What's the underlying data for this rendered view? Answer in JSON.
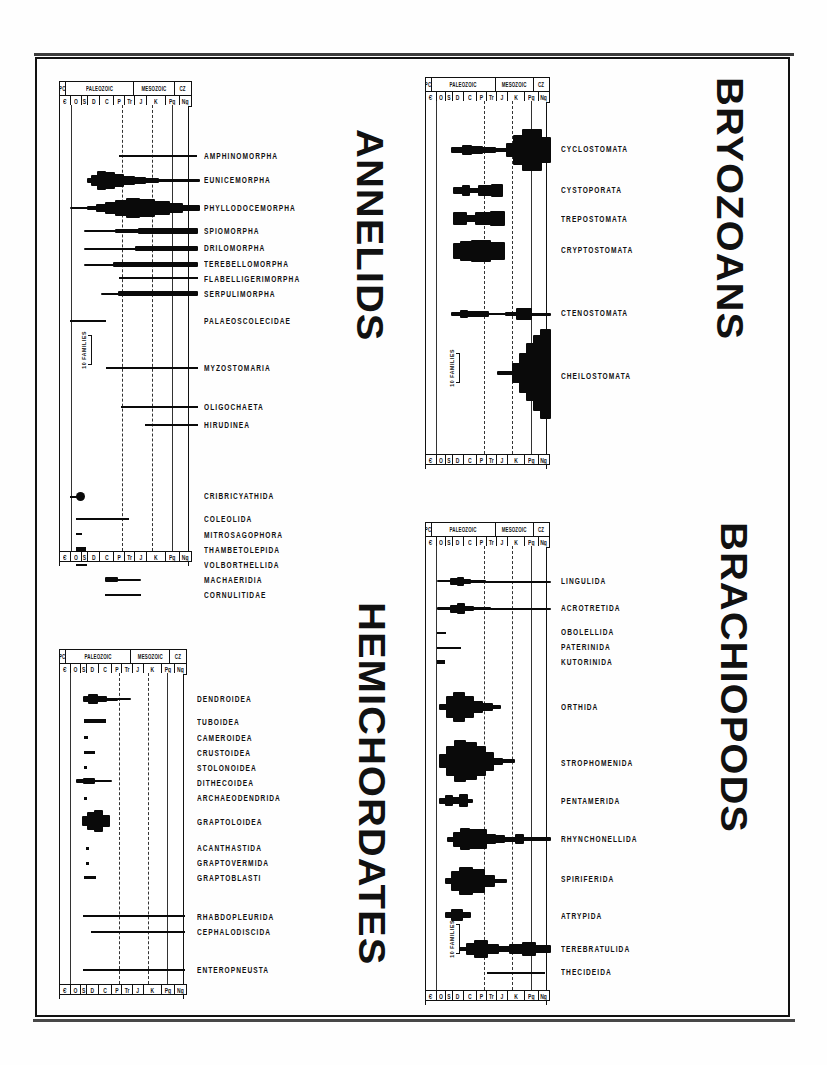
{
  "figure": {
    "kind": "spindle-diagram-plate",
    "scale_note": "10 FAMILIES",
    "ink_color": "#0a0a0a",
    "paper_color": "#fefefe"
  },
  "timescale": {
    "eras": [
      {
        "label": "PC",
        "width": 5
      },
      {
        "label": "PALEOZOIC",
        "width": 52
      },
      {
        "label": "MESOZOIC",
        "width": 31
      },
      {
        "label": "CZ",
        "width": 12
      }
    ],
    "periods": [
      {
        "label": "Є",
        "width": 9
      },
      {
        "label": "O",
        "width": 8
      },
      {
        "label": "S",
        "width": 5
      },
      {
        "label": "D",
        "width": 9
      },
      {
        "label": "C",
        "width": 11
      },
      {
        "label": "P",
        "width": 8
      },
      {
        "label": "Tr",
        "width": 8
      },
      {
        "label": "J",
        "width": 9
      },
      {
        "label": "K",
        "width": 14
      },
      {
        "label": "Pg",
        "width": 11
      },
      {
        "label": "Ng",
        "width": 8
      }
    ]
  },
  "panels": [
    {
      "id": "annelids",
      "title": "ANNELIDS",
      "taxa": [
        {
          "name": "AMPHINOMORPHA",
          "label_y": 75
        },
        {
          "name": "EUNICEMORPHA",
          "label_y": 99
        },
        {
          "name": "PHYLLODOCEMORPHA",
          "label_y": 127
        },
        {
          "name": "SPIOMORPHA",
          "label_y": 150
        },
        {
          "name": "DRILOMORPHA",
          "label_y": 167
        },
        {
          "name": "TEREBELLOMORPHA",
          "label_y": 183
        },
        {
          "name": "FLABELLIGERIMORPHA",
          "label_y": 198
        },
        {
          "name": "SERPULIMORPHA",
          "label_y": 213
        },
        {
          "name": "PALAEOSCOLECIDAE",
          "label_y": 240
        },
        {
          "name": "MYZOSTOMARIA",
          "label_y": 287
        },
        {
          "name": "OLIGOCHAETA",
          "label_y": 326
        },
        {
          "name": "HIRUDINEA",
          "label_y": 344
        },
        {
          "name": "CRIBRICYATHIDA",
          "label_y": 415
        },
        {
          "name": "COLEOLIDA",
          "label_y": 438
        },
        {
          "name": "MITROSAGOPHORA",
          "label_y": 454
        },
        {
          "name": "THAMBETOLEPIDA",
          "label_y": 469
        },
        {
          "name": "VOLBORTHELLIDA",
          "label_y": 484
        },
        {
          "name": "MACHAERIDIA",
          "label_y": 499
        },
        {
          "name": "CORNULITIDAE",
          "label_y": 514
        }
      ]
    },
    {
      "id": "bryozoans",
      "title": "BRYOZOANS",
      "taxa": [
        {
          "name": "CYCLOSTOMATA",
          "label_y": 72
        },
        {
          "name": "CYSTOPORATA",
          "label_y": 113
        },
        {
          "name": "TREPOSTOMATA",
          "label_y": 142
        },
        {
          "name": "CRYPTOSTOMATA",
          "label_y": 172
        },
        {
          "name": "CTENOSTOMATA",
          "label_y": 234
        },
        {
          "name": "CHEILOSTOMATA",
          "label_y": 297
        }
      ]
    },
    {
      "id": "hemichordates",
      "title": "HEMICHORDATES",
      "taxa": [
        {
          "name": "DENDROIDEA",
          "label_y": 49
        },
        {
          "name": "TUBOIDEA",
          "label_y": 72
        },
        {
          "name": "CAMEROIDEA",
          "label_y": 88
        },
        {
          "name": "CRUSTOIDEA",
          "label_y": 103
        },
        {
          "name": "STOLONOIDEA",
          "label_y": 118
        },
        {
          "name": "DITHECOIDEA",
          "label_y": 133
        },
        {
          "name": "ARCHAEODENDRIDA",
          "label_y": 148
        },
        {
          "name": "GRAPTOLOIDEA",
          "label_y": 172
        },
        {
          "name": "ACANTHASTIDA",
          "label_y": 198
        },
        {
          "name": "GRAPTOVERMIDA",
          "label_y": 213
        },
        {
          "name": "GRAPTOBLASTI",
          "label_y": 228
        },
        {
          "name": "RHABDOPLEURIDA",
          "label_y": 267
        },
        {
          "name": "CEPHALODISCIDA",
          "label_y": 282
        },
        {
          "name": "ENTEROPNEUSTA",
          "label_y": 320
        }
      ]
    },
    {
      "id": "brachiopods",
      "title": "BRACHIOPODS",
      "taxa": [
        {
          "name": "LINGULIDA",
          "label_y": 59
        },
        {
          "name": "ACROTRETIDA",
          "label_y": 86
        },
        {
          "name": "OBOLELLIDA",
          "label_y": 110
        },
        {
          "name": "PATERINIDA",
          "label_y": 125
        },
        {
          "name": "KUTORINIDA",
          "label_y": 140
        },
        {
          "name": "ORTHIDA",
          "label_y": 185
        },
        {
          "name": "STROPHOMENIDA",
          "label_y": 241
        },
        {
          "name": "PENTAMERIDA",
          "label_y": 279
        },
        {
          "name": "RHYNCHONELLIDA",
          "label_y": 317
        },
        {
          "name": "SPIRIFERIDA",
          "label_y": 357
        },
        {
          "name": "ATRYPIDA",
          "label_y": 394
        },
        {
          "name": "TEREBRATULIDA",
          "label_y": 427
        },
        {
          "name": "THECIDEIDA",
          "label_y": 450
        }
      ]
    }
  ],
  "chart_data": {
    "type": "area",
    "xlabel": "Geologic time (periods)",
    "ylabel": "Taxonomic group",
    "grid": true,
    "legend": "none",
    "x_axis": {
      "eras": [
        "PC",
        "PALEOZOIC",
        "MESOZOIC",
        "CZ"
      ],
      "periods": [
        "Є",
        "O",
        "S",
        "D",
        "C",
        "P",
        "Tr",
        "J",
        "K",
        "Pg",
        "Ng"
      ],
      "period_names": [
        "Cambrian",
        "Ordovician",
        "Silurian",
        "Devonian",
        "Carboniferous",
        "Permian",
        "Triassic",
        "Jurassic",
        "Cretaceous",
        "Paleogene",
        "Neogene"
      ]
    },
    "y_scale_unit": "10 FAMILIES",
    "series": [
      {
        "name": "AMPHINOMORPHA",
        "group": "Annelids",
        "range": [
          "C",
          "Ng"
        ],
        "max_families": 1
      },
      {
        "name": "EUNICEMORPHA",
        "group": "Annelids",
        "range": [
          "O",
          "Ng"
        ],
        "max_families": 9
      },
      {
        "name": "PHYLLODOCEMORPHA",
        "group": "Annelids",
        "range": [
          "Є",
          "Ng"
        ],
        "max_families": 14
      },
      {
        "name": "SPIOMORPHA",
        "group": "Annelids",
        "range": [
          "O",
          "Ng"
        ],
        "max_families": 3
      },
      {
        "name": "DRILOMORPHA",
        "group": "Annelids",
        "range": [
          "O",
          "Ng"
        ],
        "max_families": 2
      },
      {
        "name": "TEREBELLOMORPHA",
        "group": "Annelids",
        "range": [
          "O",
          "Ng"
        ],
        "max_families": 3
      },
      {
        "name": "FLABELLIGERIMORPHA",
        "group": "Annelids",
        "range": [
          "C",
          "Ng"
        ],
        "max_families": 1
      },
      {
        "name": "SERPULIMORPHA",
        "group": "Annelids",
        "range": [
          "S",
          "Ng"
        ],
        "max_families": 4
      },
      {
        "name": "PALAEOSCOLECIDAE",
        "group": "Annelids",
        "range": [
          "Є",
          "S"
        ],
        "max_families": 1
      },
      {
        "name": "MYZOSTOMARIA",
        "group": "Annelids",
        "range": [
          "D",
          "Ng"
        ],
        "max_families": 1
      },
      {
        "name": "OLIGOCHAETA",
        "group": "Annelids",
        "range": [
          "C",
          "Ng"
        ],
        "max_families": 1
      },
      {
        "name": "HIRUDINEA",
        "group": "Annelids",
        "range": [
          "J",
          "Ng"
        ],
        "max_families": 1
      },
      {
        "name": "CRIBRICYATHIDA",
        "group": "Annelids",
        "range": [
          "Є",
          "Є"
        ],
        "max_families": 4
      },
      {
        "name": "COLEOLIDA",
        "group": "Annelids",
        "range": [
          "Є",
          "O"
        ],
        "max_families": 1
      },
      {
        "name": "MITROSAGOPHORA",
        "group": "Annelids",
        "range": [
          "Є",
          "Є"
        ],
        "max_families": 1
      },
      {
        "name": "THAMBETOLEPIDA",
        "group": "Annelids",
        "range": [
          "Є",
          "Є"
        ],
        "max_families": 2
      },
      {
        "name": "VOLBORTHELLIDA",
        "group": "Annelids",
        "range": [
          "Є",
          "Є"
        ],
        "max_families": 1
      },
      {
        "name": "MACHAERIDIA",
        "group": "Annelids",
        "range": [
          "O",
          "C"
        ],
        "max_families": 3
      },
      {
        "name": "CORNULITIDAE",
        "group": "Annelids",
        "range": [
          "O",
          "C"
        ],
        "max_families": 1
      },
      {
        "name": "CYCLOSTOMATA",
        "group": "Bryozoans",
        "range": [
          "O",
          "Ng"
        ],
        "max_families": 20
      },
      {
        "name": "CYSTOPORATA",
        "group": "Bryozoans",
        "range": [
          "O",
          "P"
        ],
        "max_families": 6
      },
      {
        "name": "TREPOSTOMATA",
        "group": "Bryozoans",
        "range": [
          "O",
          "Tr"
        ],
        "max_families": 7
      },
      {
        "name": "CRYPTOSTOMATA",
        "group": "Bryozoans",
        "range": [
          "O",
          "P"
        ],
        "max_families": 10
      },
      {
        "name": "CTENOSTOMATA",
        "group": "Bryozoans",
        "range": [
          "O",
          "Ng"
        ],
        "max_families": 6
      },
      {
        "name": "CHEILOSTOMATA",
        "group": "Bryozoans",
        "range": [
          "J",
          "Ng"
        ],
        "max_families": 40
      },
      {
        "name": "DENDROIDEA",
        "group": "Hemichordates",
        "range": [
          "Є",
          "C"
        ],
        "max_families": 4
      },
      {
        "name": "TUBOIDEA",
        "group": "Hemichordates",
        "range": [
          "O",
          "S"
        ],
        "max_families": 2
      },
      {
        "name": "CAMEROIDEA",
        "group": "Hemichordates",
        "range": [
          "O",
          "O"
        ],
        "max_families": 1
      },
      {
        "name": "CRUSTOIDEA",
        "group": "Hemichordates",
        "range": [
          "O",
          "S"
        ],
        "max_families": 1
      },
      {
        "name": "STOLONOIDEA",
        "group": "Hemichordates",
        "range": [
          "O",
          "O"
        ],
        "max_families": 1
      },
      {
        "name": "DITHECOIDEA",
        "group": "Hemichordates",
        "range": [
          "Є",
          "O"
        ],
        "max_families": 3
      },
      {
        "name": "ARCHAEODENDRIDA",
        "group": "Hemichordates",
        "range": [
          "Є",
          "O"
        ],
        "max_families": 1
      },
      {
        "name": "GRAPTOLOIDEA",
        "group": "Hemichordates",
        "range": [
          "O",
          "D"
        ],
        "max_families": 9
      },
      {
        "name": "ACANTHASTIDA",
        "group": "Hemichordates",
        "range": [
          "O",
          "O"
        ],
        "max_families": 1
      },
      {
        "name": "GRAPTOVERMIDA",
        "group": "Hemichordates",
        "range": [
          "O",
          "O"
        ],
        "max_families": 1
      },
      {
        "name": "GRAPTOBLASTI",
        "group": "Hemichordates",
        "range": [
          "O",
          "S"
        ],
        "max_families": 1
      },
      {
        "name": "RHABDOPLEURIDA",
        "group": "Hemichordates",
        "range": [
          "Є",
          "Ng"
        ],
        "max_families": 1
      },
      {
        "name": "CEPHALODISCIDA",
        "group": "Hemichordates",
        "range": [
          "Є",
          "Ng"
        ],
        "max_families": 1
      },
      {
        "name": "ENTEROPNEUSTA",
        "group": "Hemichordates",
        "range": [
          "Є",
          "Ng"
        ],
        "max_families": 1
      },
      {
        "name": "LINGULIDA",
        "group": "Brachiopods",
        "range": [
          "Є",
          "Ng"
        ],
        "max_families": 5
      },
      {
        "name": "ACROTRETIDA",
        "group": "Brachiopods",
        "range": [
          "Є",
          "Ng"
        ],
        "max_families": 6
      },
      {
        "name": "OBOLELLIDA",
        "group": "Brachiopods",
        "range": [
          "Є",
          "Є"
        ],
        "max_families": 1
      },
      {
        "name": "PATERINIDA",
        "group": "Brachiopods",
        "range": [
          "Є",
          "O"
        ],
        "max_families": 1
      },
      {
        "name": "KUTORINIDA",
        "group": "Brachiopods",
        "range": [
          "Є",
          "Є"
        ],
        "max_families": 2
      },
      {
        "name": "ORTHIDA",
        "group": "Brachiopods",
        "range": [
          "Є",
          "P"
        ],
        "max_families": 16
      },
      {
        "name": "STROPHOMENIDA",
        "group": "Brachiopods",
        "range": [
          "Є",
          "Tr"
        ],
        "max_families": 26
      },
      {
        "name": "PENTAMERIDA",
        "group": "Brachiopods",
        "range": [
          "Є",
          "D"
        ],
        "max_families": 6
      },
      {
        "name": "RHYNCHONELLIDA",
        "group": "Brachiopods",
        "range": [
          "O",
          "Ng"
        ],
        "max_families": 14
      },
      {
        "name": "SPIRIFERIDA",
        "group": "Brachiopods",
        "range": [
          "O",
          "J"
        ],
        "max_families": 18
      },
      {
        "name": "ATRYPIDA",
        "group": "Brachiopods",
        "range": [
          "O",
          "D"
        ],
        "max_families": 5
      },
      {
        "name": "TEREBRATULIDA",
        "group": "Brachiopods",
        "range": [
          "S",
          "Ng"
        ],
        "max_families": 12
      },
      {
        "name": "THECIDEIDA",
        "group": "Brachiopods",
        "range": [
          "Tr",
          "Ng"
        ],
        "max_families": 2
      }
    ]
  }
}
